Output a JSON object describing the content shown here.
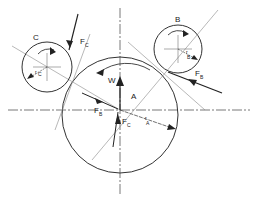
{
  "diagram": {
    "type": "force-diagram",
    "colors": {
      "stroke": "#333333",
      "light": "#888888",
      "background": "#ffffff"
    },
    "labels": {
      "roll_b": "B",
      "roll_c": "C",
      "center_a": "A",
      "weight": "W",
      "force_b": "F",
      "force_b_sub": "B",
      "force_c": "F",
      "force_c_sub": "C",
      "force_b_center": "F",
      "force_b_center_sub": "B",
      "force_c_center": "F",
      "force_c_center_sub": "C",
      "radius_a": "r",
      "radius_a_sub": "A",
      "radius_b": "r",
      "radius_b_sub": "B",
      "radius_c": "r",
      "radius_c_sub": "C"
    }
  }
}
